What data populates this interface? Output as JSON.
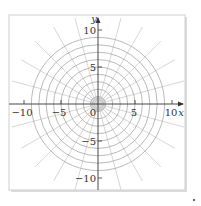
{
  "chart_data": {
    "type": "polar-grid",
    "title": "",
    "xlabel": "x",
    "ylabel": "y",
    "xlim": [
      -12,
      11
    ],
    "ylim": [
      -12,
      12
    ],
    "x_ticks": [
      -10,
      -5,
      0,
      5,
      10
    ],
    "y_ticks": [
      -10,
      -5,
      5,
      10
    ],
    "x_tick_labels": [
      "-10",
      "-5",
      "0",
      "5",
      "10"
    ],
    "y_tick_labels": [
      "-10",
      "-5",
      "5",
      "10"
    ],
    "circle_radii": [
      0.25,
      0.5,
      0.75,
      1,
      2,
      3,
      4,
      5,
      6,
      7,
      8,
      9
    ],
    "ray_angle_step_deg": 15,
    "ray_length": 12,
    "grid": true,
    "legend": null
  },
  "axis": {
    "x_label": "x",
    "y_label": "y",
    "origin_label": "0"
  },
  "colors": {
    "frame": "#c8c8c8",
    "grid": "#a8a8a8",
    "rays": "#c4c4c4",
    "axes": "#333333"
  }
}
